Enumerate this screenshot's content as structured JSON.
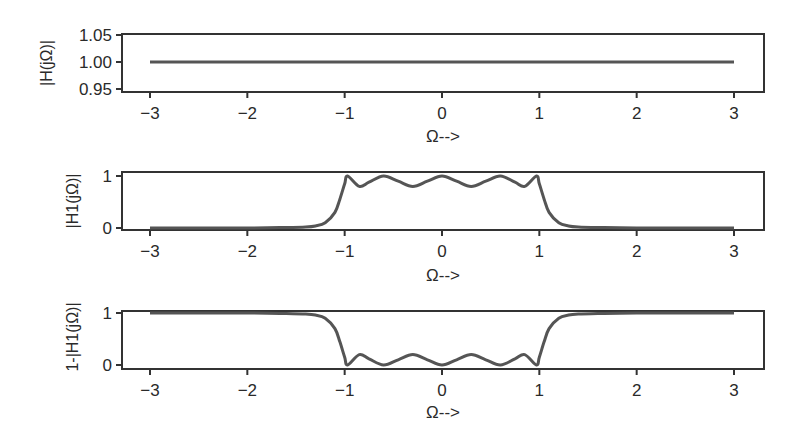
{
  "chart_data": [
    {
      "type": "line",
      "title": "",
      "xlabel": "Ω-->",
      "ylabel": "|H(jΩ)|",
      "xlim": [
        -3,
        3
      ],
      "ylim": [
        0.95,
        1.05
      ],
      "xticks": [
        "−3",
        "−2",
        "−1",
        "0",
        "1",
        "2",
        "3"
      ],
      "yticks": [
        "1.05",
        "1.00",
        "0.95"
      ],
      "grid": false,
      "series": [
        {
          "name": "|H(jΩ)|",
          "x": [
            -3,
            -2,
            -1,
            0,
            1,
            2,
            3
          ],
          "y": [
            1.0,
            1.0,
            1.0,
            1.0,
            1.0,
            1.0,
            1.0
          ]
        }
      ]
    },
    {
      "type": "line",
      "title": "",
      "xlabel": "Ω-->",
      "ylabel": "|H1(jΩ)|",
      "xlim": [
        -3,
        3
      ],
      "ylim": [
        0,
        1
      ],
      "xticks": [
        "−3",
        "−2",
        "−1",
        "0",
        "1",
        "2",
        "3"
      ],
      "yticks": [
        "1",
        "0"
      ],
      "grid": false,
      "series": [
        {
          "name": "|H1(jΩ)|",
          "x": [
            -3,
            -2,
            -1.6,
            -1.4,
            -1.3,
            -1.2,
            -1.1,
            -1.05,
            -1.0,
            -0.97,
            -0.85,
            -0.75,
            -0.6,
            -0.45,
            -0.3,
            -0.15,
            0,
            0.15,
            0.3,
            0.45,
            0.6,
            0.75,
            0.85,
            0.97,
            1.0,
            1.05,
            1.1,
            1.2,
            1.3,
            1.4,
            1.6,
            2,
            3
          ],
          "y": [
            0.0,
            0.0,
            0.01,
            0.02,
            0.04,
            0.1,
            0.3,
            0.55,
            0.85,
            1.0,
            0.8,
            0.88,
            1.0,
            0.9,
            0.8,
            0.9,
            1.0,
            0.9,
            0.8,
            0.9,
            1.0,
            0.88,
            0.8,
            1.0,
            0.85,
            0.55,
            0.3,
            0.1,
            0.04,
            0.02,
            0.01,
            0.0,
            0.0
          ]
        }
      ]
    },
    {
      "type": "line",
      "title": "",
      "xlabel": "Ω-->",
      "ylabel": "1-|H1(jΩ)|",
      "xlim": [
        -3,
        3
      ],
      "ylim": [
        0,
        1
      ],
      "xticks": [
        "−3",
        "−2",
        "−1",
        "0",
        "1",
        "2",
        "3"
      ],
      "yticks": [
        "1",
        "0"
      ],
      "grid": false,
      "series": [
        {
          "name": "1-|H1(jΩ)|",
          "x": [
            -3,
            -2,
            -1.6,
            -1.4,
            -1.3,
            -1.2,
            -1.1,
            -1.05,
            -1.0,
            -0.97,
            -0.85,
            -0.75,
            -0.6,
            -0.45,
            -0.3,
            -0.15,
            0,
            0.15,
            0.3,
            0.45,
            0.6,
            0.75,
            0.85,
            0.97,
            1.0,
            1.05,
            1.1,
            1.2,
            1.3,
            1.4,
            1.6,
            2,
            3
          ],
          "y": [
            1.0,
            1.0,
            0.99,
            0.98,
            0.96,
            0.9,
            0.7,
            0.45,
            0.15,
            0.0,
            0.2,
            0.12,
            0.0,
            0.1,
            0.2,
            0.1,
            0.0,
            0.1,
            0.2,
            0.1,
            0.0,
            0.12,
            0.2,
            0.0,
            0.15,
            0.45,
            0.7,
            0.9,
            0.96,
            0.98,
            0.99,
            1.0,
            1.0
          ]
        }
      ]
    }
  ],
  "layout": {
    "line_color": "#555555",
    "axis_color": "#333333",
    "panels": [
      {
        "box": [
          122,
          34,
          642,
          58
        ],
        "yticks_px": [
          35,
          62,
          89
        ]
      },
      {
        "box": [
          122,
          172,
          642,
          58
        ],
        "yticks_px": [
          176,
          228
        ]
      },
      {
        "box": [
          122,
          311,
          642,
          58
        ],
        "yticks_px": [
          313,
          365
        ]
      }
    ],
    "x_px": {
      "min_val": -3,
      "min_px": 150,
      "max_val": 3,
      "max_px": 734
    }
  }
}
